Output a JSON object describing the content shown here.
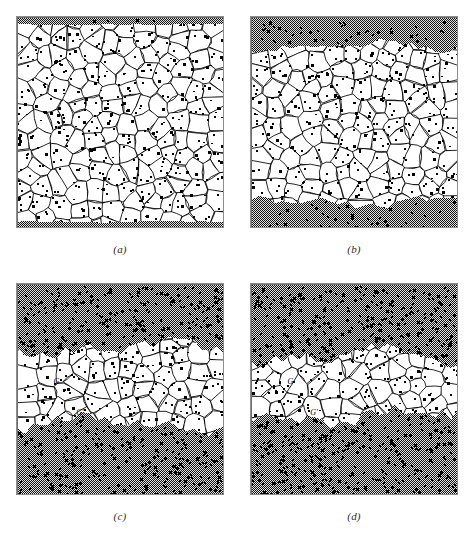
{
  "figure": {
    "kind": "scanned-textbook-figure",
    "background_color": "#ffffff",
    "frame_color": "#8d8d8d",
    "grain_fill": "#ffffff",
    "grain_outline": "#000000",
    "matrix_color": "#3a3a3a",
    "dot_color": "#000000",
    "width": 471,
    "height": 536,
    "footer_partial_text": ""
  },
  "panels": [
    {
      "id": "a",
      "caption": "(a)",
      "x": 16,
      "y": 16,
      "width": 208,
      "height": 212,
      "caption_y": 243,
      "top_band": 0.035,
      "bottom_band": 0.035,
      "band_roughness": 0.006,
      "seed": 1307,
      "grain_count": 150,
      "labels": []
    },
    {
      "id": "b",
      "caption": "(b)",
      "x": 250,
      "y": 16,
      "width": 208,
      "height": 212,
      "caption_y": 243,
      "top_band": 0.14,
      "bottom_band": 0.13,
      "band_roughness": 0.035,
      "seed": 2411,
      "grain_count": 150,
      "labels": []
    },
    {
      "id": "c",
      "caption": "(c)",
      "x": 16,
      "y": 283,
      "width": 208,
      "height": 212,
      "caption_y": 510,
      "top_band": 0.3,
      "bottom_band": 0.34,
      "band_roughness": 0.055,
      "seed": 3529,
      "grain_count": 150,
      "labels": [
        {
          "text": "G",
          "x": 0.175,
          "y": 0.47
        },
        {
          "text": "G'",
          "x": 0.285,
          "y": 0.62
        }
      ]
    },
    {
      "id": "d",
      "caption": "(d)",
      "x": 250,
      "y": 283,
      "width": 208,
      "height": 212,
      "caption_y": 510,
      "top_band": 0.345,
      "bottom_band": 0.375,
      "band_roughness": 0.06,
      "seed": 4637,
      "grain_count": 150,
      "labels": [
        {
          "text": "G",
          "x": 0.175,
          "y": 0.47
        },
        {
          "text": "G'",
          "x": 0.285,
          "y": 0.62
        }
      ]
    }
  ],
  "chart_data": {
    "type": "diagram",
    "panel_ids": [
      "a",
      "b",
      "c",
      "d"
    ],
    "white_grain_band_fraction": [
      0.93,
      0.73,
      0.36,
      0.28
    ],
    "dark_matrix_fraction": [
      0.07,
      0.27,
      0.64,
      0.72
    ],
    "annotations": [
      "G",
      "G'"
    ]
  }
}
